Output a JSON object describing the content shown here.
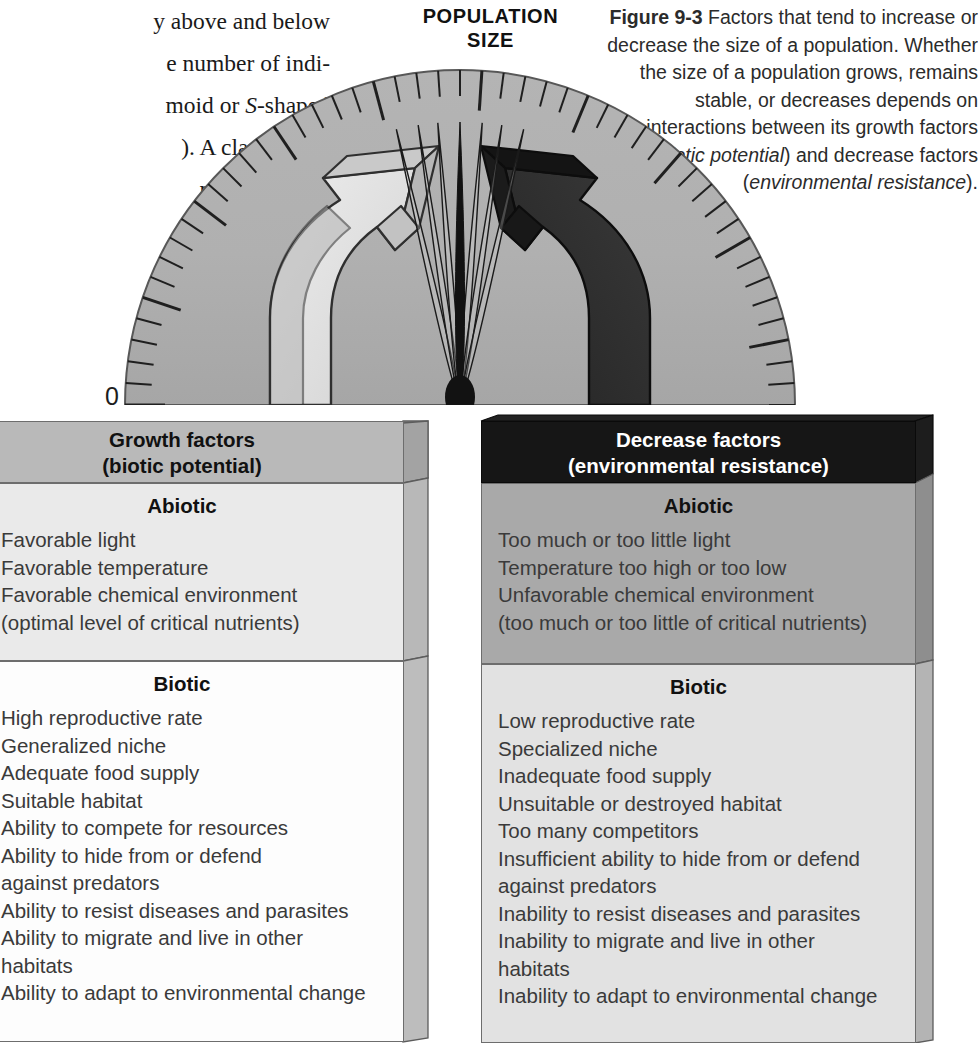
{
  "body_text": {
    "lines": [
      {
        "text": "y above and below",
        "italic_parts": []
      },
      {
        "text": "e number of indi-",
        "italic_parts": []
      },
      {
        "text": "moid or S-shaped",
        "italic_parts": [
          "S"
        ]
      },
      {
        "text": "). A classic case",
        "italic_parts": []
      },
      {
        "text": "ncrease of the",
        "italic_parts": []
      },
      {
        "text": "of Tasmania,",
        "italic_parts": []
      },
      {
        "text": "th century",
        "italic_parts": []
      }
    ],
    "section_heading": "on Size"
  },
  "caption": {
    "figure_number": "Figure 9-3",
    "text_before_italic1": " Factors that tend to increase or decrease the size of a population. Whether the size of a population grows, remains stable, or decreases depends on interactions between its growth factors (",
    "italic1": "biotic potential",
    "between": ") and decrease factors (",
    "italic2": "environmental resistance",
    "after": ")."
  },
  "gauge": {
    "label": "POPULATION\nSIZE",
    "zero_label": "0",
    "needle_state": "vibrating-at-center",
    "tick_count": 49,
    "dial_fill": "#b0b0b0",
    "needle_color": "#121212"
  },
  "arrows": {
    "left": {
      "name": "growth-arrow",
      "direction": "up-right",
      "fill": "#d8d8d8",
      "stroke": "#2a2a2a"
    },
    "right": {
      "name": "decrease-arrow",
      "direction": "up-left",
      "fill": "#2e2e2e",
      "stroke": "#101010"
    }
  },
  "panels": {
    "left": {
      "header": "Growth factors\n(biotic potential)",
      "sections": [
        {
          "title": "Abiotic",
          "items": [
            "Favorable light",
            "Favorable temperature",
            "Favorable chemical environment\n(optimal level of critical nutrients)"
          ]
        },
        {
          "title": "Biotic",
          "items": [
            "High reproductive rate",
            "Generalized niche",
            "Adequate food supply",
            "Suitable habitat",
            "Ability to compete for resources",
            "Ability to hide from or defend\nagainst predators",
            "Ability to resist diseases and parasites",
            "Ability to migrate and live in other\nhabitats",
            "Ability to adapt to environmental change"
          ]
        }
      ]
    },
    "right": {
      "header": "Decrease factors\n(environmental resistance)",
      "sections": [
        {
          "title": "Abiotic",
          "items": [
            "Too much or too little light",
            "Temperature too high or too low",
            "Unfavorable chemical environment\n(too much or too little of critical nutrients)"
          ]
        },
        {
          "title": "Biotic",
          "items": [
            "Low reproductive rate",
            "Specialized niche",
            "Inadequate food supply",
            "Unsuitable or destroyed habitat",
            "Too many competitors",
            "Insufficient ability to hide from or defend\nagainst predators",
            "Inability to resist diseases and parasites",
            "Inability to migrate and live in other\nhabitats",
            "Inability to adapt to environmental change"
          ]
        }
      ]
    }
  }
}
